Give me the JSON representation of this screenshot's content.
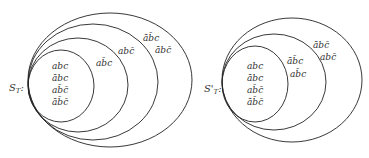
{
  "diagrams": [
    {
      "set_label": "S",
      "set_sub": "T",
      "set_suffix": ":",
      "regions": [
        {
          "labels": [
            "abc",
            "ābc",
            "ab̄c̄",
            "āb̄c̄"
          ]
        },
        {
          "labels": [
            "ab̄c"
          ]
        },
        {
          "labels": [
            "abc̄"
          ]
        },
        {
          "labels": [
            "āb̄c",
            "ābc̄"
          ]
        }
      ]
    },
    {
      "set_label": "S'",
      "set_sub": "T",
      "set_suffix": ":",
      "regions": [
        {
          "labels": [
            "abc",
            "ābc",
            "ab̄c̄",
            "āb̄c̄"
          ]
        },
        {
          "labels": [
            "āb̄c",
            "ab̄c"
          ]
        },
        {
          "labels": [
            "ābc̄",
            "abc̄"
          ]
        }
      ]
    }
  ]
}
